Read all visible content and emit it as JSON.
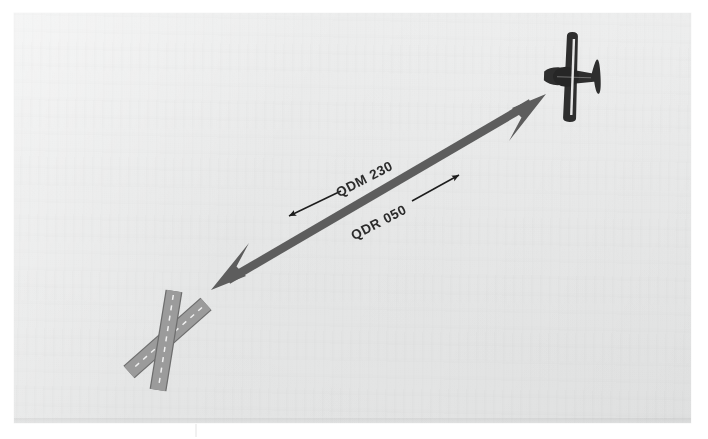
{
  "figure": {
    "page_background": "#e8e9e9",
    "outer_background": "#ffffff"
  },
  "labels": {
    "qdm": "QDM 230",
    "qdr": "QDR 050"
  },
  "annotations": [
    {
      "name": "qdm-direction-arrow",
      "label": "QDM 230",
      "description": "thin arrow pointing toward the station (down-left)",
      "direction": "down-left",
      "from": [
        341,
        191
      ],
      "to": [
        287,
        217
      ]
    },
    {
      "name": "qdr-direction-arrow",
      "label": "QDR 050",
      "description": "thin arrow pointing away from the station (up-right)",
      "direction": "up-right",
      "from": [
        412,
        201
      ],
      "to": [
        461,
        174
      ]
    }
  ],
  "main_arrow": {
    "name": "bearing-double-arrow",
    "color": "#5d5d5d",
    "shaft_width_px": 8,
    "tail_tip": [
      211,
      290
    ],
    "head_tip": [
      546,
      94
    ],
    "bearing_to_station_deg": 230,
    "bearing_from_station_deg": 50
  },
  "aircraft": {
    "name": "aircraft-symbol",
    "color": "#2e2e2e",
    "center": [
      571,
      77
    ],
    "heading": "nose-left",
    "wingspan_px": 90
  },
  "airfield": {
    "name": "airfield-runway-cross",
    "surface_color": "#9b9b9b",
    "outline_color": "#6d6d6d",
    "centerline_color": "#f2f2f2",
    "runways": [
      {
        "name": "runway-primary",
        "from": [
          174,
          291
        ],
        "to": [
          158,
          390
        ],
        "width_px": 15
      },
      {
        "name": "runway-secondary",
        "from": [
          206,
          304
        ],
        "to": [
          129,
          372
        ],
        "width_px": 15
      }
    ]
  },
  "colors": {
    "arrow_gray": "#5d5d5d",
    "aircraft_dark": "#2e2e2e",
    "runway_gray": "#9b9b9b",
    "text_dark": "#2b2b2b",
    "paper": "#e8e9e9"
  }
}
